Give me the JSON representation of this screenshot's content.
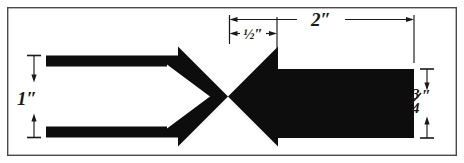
{
  "figure": {
    "background_color": "#ffffff",
    "ink_color": "#0d0d0d",
    "frame_color": "#4a4a4a",
    "canvas": {
      "width": 464,
      "height": 163
    }
  },
  "frame": {
    "name": "border-frame",
    "x": 7,
    "y": 7,
    "width": 450,
    "height": 149
  },
  "shapes": [
    {
      "id": "left-arrow",
      "label": "outline arrow pointing right",
      "style": "outline",
      "direction": "right",
      "fill": "#0d0d0d"
    },
    {
      "id": "right-arrow",
      "label": "solid arrow pointing left",
      "style": "solid",
      "direction": "left",
      "fill": "#0d0d0d"
    }
  ],
  "dimensions": [
    {
      "id": "height-left",
      "text": "1″",
      "value": "1",
      "unit": "inch",
      "orientation": "vertical",
      "position": "left",
      "measures": "overall height of the outline arrow"
    },
    {
      "id": "gap-half",
      "text": "½″",
      "value": "0.5",
      "unit": "inch",
      "orientation": "horizontal",
      "position": "top",
      "measures": "distance from the outline arrow tip region to the solid arrow tail"
    },
    {
      "id": "length-two",
      "text": "2″",
      "value": "2",
      "unit": "inch",
      "orientation": "horizontal",
      "position": "top",
      "measures": "overall length of the solid arrow"
    },
    {
      "id": "height-right",
      "text": "¾″",
      "numerator": "3",
      "denominator": "4",
      "suffix": "″",
      "value": "0.75",
      "unit": "inch",
      "orientation": "vertical",
      "position": "right",
      "measures": "height of the solid arrow body"
    }
  ]
}
